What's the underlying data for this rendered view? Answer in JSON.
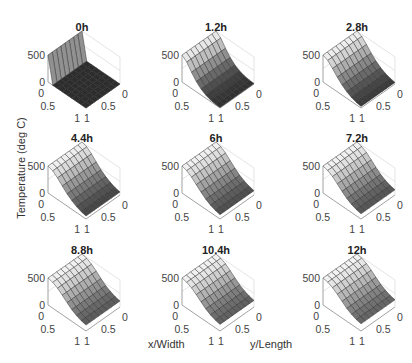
{
  "chart_data": {
    "type": "surface-grid",
    "layout": {
      "rows": 3,
      "cols": 3
    },
    "ylabel": "Temperature (deg C)",
    "xlabel": "x/Width",
    "zlabel_secondary": "y/Length",
    "zlim": [
      0,
      500
    ],
    "z_ticks": [
      "0",
      "500"
    ],
    "x_ticks": [
      "0",
      "0.5",
      "1"
    ],
    "y_ticks": [
      "0",
      "0.5",
      "1"
    ],
    "colormap": "gray",
    "grid_size": 8,
    "panels": [
      {
        "title": "0h",
        "profile": [
          500,
          0,
          0,
          0,
          0,
          0,
          0,
          0,
          0
        ]
      },
      {
        "title": "1.2h",
        "profile": [
          500,
          430,
          300,
          190,
          110,
          60,
          30,
          15,
          8
        ]
      },
      {
        "title": "2.8h",
        "profile": [
          500,
          460,
          370,
          270,
          185,
          120,
          75,
          45,
          30
        ]
      },
      {
        "title": "4.4h",
        "profile": [
          500,
          470,
          400,
          310,
          225,
          160,
          110,
          75,
          55
        ]
      },
      {
        "title": "6h",
        "profile": [
          500,
          475,
          415,
          335,
          255,
          185,
          135,
          100,
          80
        ]
      },
      {
        "title": "7.2h",
        "profile": [
          500,
          478,
          425,
          350,
          270,
          200,
          150,
          115,
          95
        ]
      },
      {
        "title": "8.8h",
        "profile": [
          500,
          480,
          432,
          362,
          285,
          215,
          165,
          130,
          110
        ]
      },
      {
        "title": "10.4h",
        "profile": [
          500,
          482,
          438,
          372,
          298,
          228,
          178,
          142,
          122
        ]
      },
      {
        "title": "12h",
        "profile": [
          500,
          484,
          442,
          380,
          308,
          238,
          188,
          152,
          132
        ]
      }
    ]
  },
  "figure": {
    "ylabel": "Temperature (deg C)",
    "xlabel": "x/Width",
    "ylabel2": "y/Length"
  }
}
